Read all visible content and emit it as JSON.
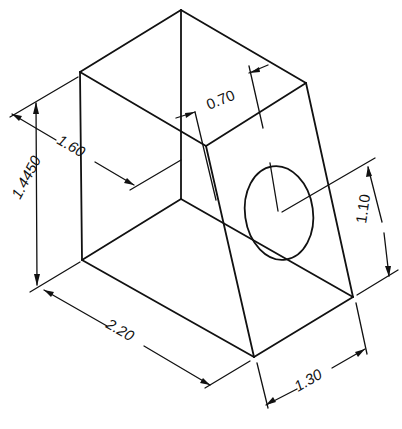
{
  "drawing": {
    "title": "Isometric view of tapered block with circular hole",
    "ink_color": "#111111",
    "background": "#ffffff"
  },
  "dimensions": {
    "height": {
      "label": "1.4450"
    },
    "depth": {
      "label": "1.60"
    },
    "top_offset": {
      "label": "0.70"
    },
    "hole_height": {
      "label": "1.10"
    },
    "length": {
      "label": "2.20"
    },
    "bottom_width": {
      "label": "1.30"
    }
  },
  "features": {
    "hole": {
      "shape": "circle",
      "face": "sloped front face"
    }
  }
}
